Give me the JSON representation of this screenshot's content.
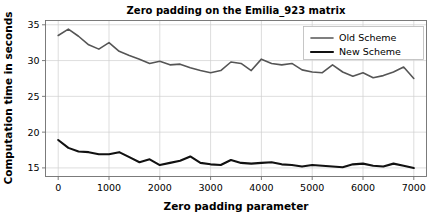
{
  "chart_data": {
    "type": "line",
    "title": "Zero padding on the Emilia_923 matrix",
    "xlabel": "Zero padding parameter",
    "ylabel": "Computation time in seconds",
    "xlim": [
      -250,
      7250
    ],
    "ylim": [
      13.8,
      35.6
    ],
    "xticks": [
      0,
      1000,
      2000,
      3000,
      4000,
      5000,
      6000,
      7000
    ],
    "xticklabels": [
      "0",
      "1000",
      "2000",
      "3000",
      "4000",
      "5000",
      "6000",
      "7000"
    ],
    "yticks": [
      15,
      20,
      25,
      30,
      35
    ],
    "yticklabels": [
      "15",
      "20",
      "25",
      "30",
      "35"
    ],
    "grid": true,
    "legend_position": "upper right",
    "x": [
      0,
      200,
      400,
      600,
      800,
      1000,
      1200,
      1400,
      1600,
      1800,
      2000,
      2200,
      2400,
      2600,
      2800,
      3000,
      3200,
      3400,
      3600,
      3800,
      4000,
      4200,
      4400,
      4600,
      4800,
      5000,
      5200,
      5400,
      5600,
      5800,
      6000,
      6200,
      6400,
      6600,
      6800,
      7000
    ],
    "series": [
      {
        "name": "Old Scheme",
        "color": "#555555",
        "linewidth": 1.6,
        "values": [
          33.5,
          34.4,
          33.4,
          32.2,
          31.6,
          32.5,
          31.3,
          30.7,
          30.2,
          29.6,
          29.9,
          29.4,
          29.5,
          29.0,
          28.6,
          28.3,
          28.6,
          29.8,
          29.6,
          28.6,
          30.2,
          29.6,
          29.4,
          29.6,
          28.7,
          28.4,
          28.3,
          29.4,
          28.4,
          27.8,
          28.3,
          27.6,
          27.9,
          28.4,
          29.1,
          27.5
        ]
      },
      {
        "name": "New Scheme",
        "color": "#111111",
        "linewidth": 2.1,
        "values": [
          18.9,
          17.8,
          17.3,
          17.2,
          16.9,
          16.9,
          17.2,
          16.5,
          15.8,
          16.2,
          15.4,
          15.7,
          16.0,
          16.6,
          15.7,
          15.5,
          15.4,
          16.1,
          15.7,
          15.6,
          15.7,
          15.8,
          15.5,
          15.4,
          15.2,
          15.4,
          15.3,
          15.2,
          15.1,
          15.5,
          15.6,
          15.3,
          15.2,
          15.6,
          15.3,
          15.0
        ]
      }
    ]
  },
  "figure": {
    "title": "Zero padding on the Emilia_923 matrix",
    "xlabel": "Zero padding parameter",
    "ylabel": "Computation time in seconds",
    "legend": [
      {
        "label": "Old Scheme"
      },
      {
        "label": "New Scheme"
      }
    ],
    "colors": {
      "old_scheme": "#555555",
      "new_scheme": "#111111",
      "grid": "#cfcfcf",
      "spine": "#6e6e6e",
      "background": "#ffffff"
    }
  }
}
